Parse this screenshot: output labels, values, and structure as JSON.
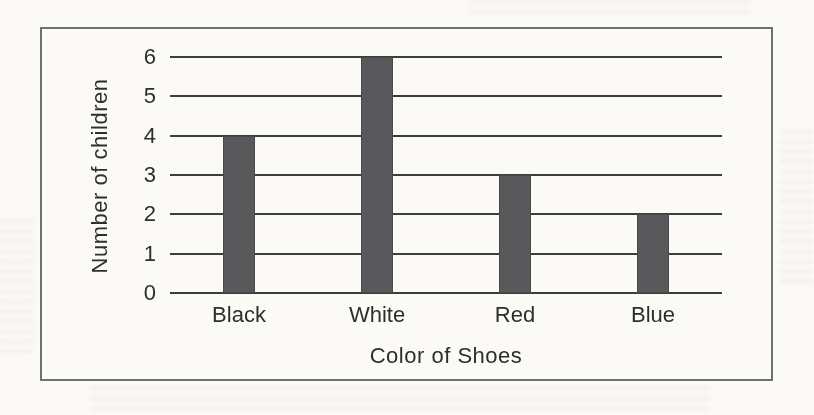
{
  "page": {
    "background_color": "#fbfaf7"
  },
  "chart_data": {
    "type": "bar",
    "categories": [
      "Black",
      "White",
      "Red",
      "Blue"
    ],
    "values": [
      4,
      6,
      3,
      2
    ],
    "xlabel": "Color of Shoes",
    "ylabel": "Number of children",
    "ylim": [
      0,
      6
    ],
    "yticks": [
      0,
      1,
      2,
      3,
      4,
      5,
      6
    ],
    "grid": true,
    "legend": "none",
    "bar_color": "#59595b",
    "gridline_color": "#3d3d3d",
    "frame_border_color": "#707070",
    "text_color": "#2e2e2e"
  }
}
